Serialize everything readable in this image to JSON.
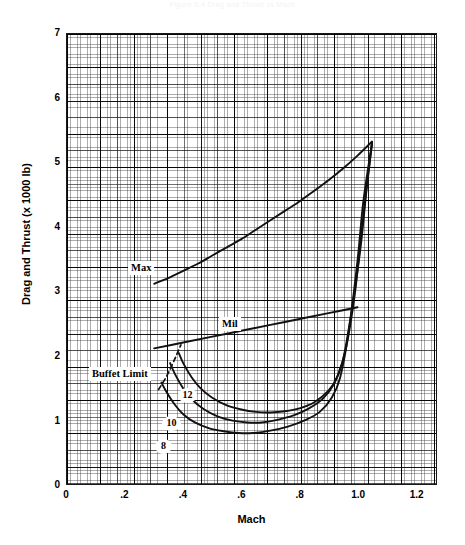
{
  "figure": {
    "top_title": "Figure 5.4  Drag and Thrust vs Mach",
    "xlabel": "Mach",
    "ylabel": "Drag and Thrust (x 1000 lb)"
  },
  "axes": {
    "xticks": [
      "0",
      ".2",
      ".4",
      ".6",
      ".8",
      "1.0",
      "1.2"
    ],
    "xtick_values": [
      0,
      0.2,
      0.4,
      0.6,
      0.8,
      1.0,
      1.2
    ],
    "yticks": [
      "0",
      "1",
      "2",
      "3",
      "4",
      "5",
      "6",
      "7"
    ],
    "ytick_values": [
      0,
      1,
      2,
      3,
      4,
      5,
      6,
      7
    ]
  },
  "annotations": {
    "max": "Max",
    "mil": "Mil",
    "buffet_limit": "Buffet Limit",
    "curve_8": "8",
    "curve_10": "10",
    "curve_12": "12"
  },
  "chart_data": {
    "type": "line",
    "title": "",
    "xlabel": "Mach",
    "ylabel": "Drag and Thrust (x 1000 lb)",
    "xlim": [
      0,
      1.27
    ],
    "ylim": [
      0,
      7.65
    ],
    "xticks": [
      0,
      0.2,
      0.4,
      0.6,
      0.8,
      1.0,
      1.2
    ],
    "yticks": [
      0,
      1,
      2,
      3,
      4,
      5,
      6,
      7
    ],
    "grid": "engineering graph paper, fine minor grid with heavier lines every 5 and 10 cells",
    "legend": "inline labels on curves",
    "series": [
      {
        "name": "Max",
        "label": "Max",
        "kind": "thrust",
        "style": "solid",
        "x": [
          0.3,
          0.35,
          0.4,
          0.45,
          0.5,
          0.55,
          0.6,
          0.65,
          0.7,
          0.75,
          0.8,
          0.85,
          0.9,
          0.95,
          1.0,
          1.05
        ],
        "y": [
          3.4,
          3.5,
          3.62,
          3.74,
          3.88,
          4.02,
          4.16,
          4.32,
          4.48,
          4.64,
          4.8,
          4.98,
          5.16,
          5.36,
          5.58,
          5.82
        ]
      },
      {
        "name": "Mil",
        "label": "Mil",
        "kind": "thrust",
        "style": "solid",
        "x": [
          0.3,
          0.4,
          0.5,
          0.6,
          0.7,
          0.8,
          0.9,
          1.0
        ],
        "y": [
          2.3,
          2.4,
          2.5,
          2.6,
          2.7,
          2.8,
          2.9,
          3.0
        ]
      },
      {
        "name": "12",
        "label": "12",
        "kind": "drag",
        "weight_lb": 12000,
        "style": "solid",
        "x": [
          0.385,
          0.4,
          0.43,
          0.46,
          0.5,
          0.55,
          0.6,
          0.65,
          0.7,
          0.75,
          0.8,
          0.85,
          0.9,
          0.93,
          0.96,
          0.99,
          1.01,
          1.03,
          1.05
        ],
        "y": [
          2.22,
          2.05,
          1.8,
          1.62,
          1.46,
          1.33,
          1.26,
          1.22,
          1.21,
          1.23,
          1.28,
          1.38,
          1.58,
          1.82,
          2.3,
          3.2,
          4.1,
          5.0,
          5.8
        ]
      },
      {
        "name": "10",
        "label": "10",
        "kind": "drag",
        "weight_lb": 10000,
        "style": "solid",
        "x": [
          0.355,
          0.37,
          0.4,
          0.43,
          0.47,
          0.52,
          0.57,
          0.62,
          0.67,
          0.72,
          0.78,
          0.83,
          0.88,
          0.92,
          0.95,
          0.98,
          1.01,
          1.03,
          1.05
        ],
        "y": [
          2.05,
          1.88,
          1.62,
          1.43,
          1.27,
          1.14,
          1.07,
          1.04,
          1.04,
          1.08,
          1.16,
          1.27,
          1.44,
          1.7,
          2.1,
          2.95,
          4.0,
          4.95,
          5.8
        ]
      },
      {
        "name": "8",
        "label": "8",
        "kind": "drag",
        "weight_lb": 8000,
        "style": "solid",
        "x": [
          0.325,
          0.34,
          0.37,
          0.4,
          0.44,
          0.49,
          0.54,
          0.59,
          0.64,
          0.7,
          0.76,
          0.82,
          0.87,
          0.91,
          0.94,
          0.97,
          1.0,
          1.02,
          1.05
        ],
        "y": [
          1.72,
          1.58,
          1.35,
          1.18,
          1.04,
          0.94,
          0.89,
          0.86,
          0.86,
          0.9,
          0.97,
          1.08,
          1.22,
          1.45,
          1.8,
          2.6,
          3.8,
          4.8,
          5.8
        ]
      },
      {
        "name": "Buffet Limit",
        "label": "Buffet Limit",
        "kind": "limit",
        "style": "dashed",
        "x": [
          0.315,
          0.34,
          0.36,
          0.378,
          0.392
        ],
        "y": [
          1.6,
          1.8,
          2.0,
          2.2,
          2.36
        ]
      }
    ]
  },
  "colors": {
    "curve": "#111111",
    "grid_minor": "#6d6d6d",
    "grid_major": "#000000",
    "background": "#ffffff"
  }
}
